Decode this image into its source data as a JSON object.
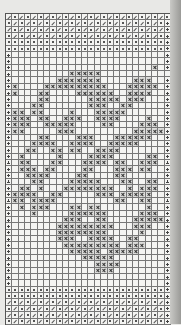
{
  "chart": {
    "title": "",
    "columns": 26,
    "symbols": {
      ".": "empty",
      "x": "cross-stitch",
      "d": "dot",
      "s": "slash",
      "p": "plus",
      "m": "minus"
    },
    "rows": [
      "sdsdsdsdsdsdsdsdsdsdsdsdsd",
      "dsdsdsdsdsdsdsdsdsdsdsdsdp",
      "sdsdsdsdsdsdsdsdsdsdsdsdsp",
      "dsdsdsdsdsdsdsdsdsdsdsdsdp",
      "dddddddddddddddddddddddddp",
      "dddddddddddddddddddddddddp",
      "p........................p",
      "p........................p",
      "p......................x.p",
      "p.........xxxxx...........",
      "p.......xxxxxxx.....xxx..p",
      "px....xxxxxxxxxx...xxxxx.p",
      "px...xx....xxxxxx..xxxx..p",
      "p....xx......xxxxx.xxx...p",
      "p...xx.......xxx..xx.....p",
      "pxx.xx....x...xxxxx......p",
      "pxxx.xx..xxx..xxxx....x..p",
      "pxxx..xxxxx....xx....xxx.p",
      "pxx.....xxx.........xxxxxp",
      "p....xx....xxx...xxxxxx..p",
      "p...xxxx..xxxx..xxxxx....p",
      "p..xx..xx.xx..xxxx.......p",
      "p.x.....x....xxxx.....xx.p",
      "p.xx...xx...xxxx.xx..xxx.p",
      "p.xxx.xx....xx...xxx.xx..p",
      "p..xxxx....xx....xx......p",
      "p...xx....xxxxx...xx..xx.p",
      "p.xx.x...xxxxxxxx..x.xxx.p",
      "pxxxx..xx.....xxx.xxxxx..p",
      "pxx.xxxx.........xx..xx..p",
      "p.x.xxx...xx.xx.......x..p",
      "p...x.....xxxxxx.....xxx.p",
      "p........xxx..xx....xxxxxp",
      "p.......xxxxxxxxx...xxx..p",
      "p.......xxxxxxxx.....x...p",
      "p.......xxx..xxxx..xx....p",
      "p........xxxxxxxxx.xxx...p",
      "p.........xxxxx.xxxxx....p",
      "p...........xxxxx........p",
      "p.............xxxx.......p",
      "p.............xxx........p",
      "p........................p",
      "p........................p",
      "dddddddddddddddddddddddddp",
      "dddddddddddddddddddddddddp",
      "sdsdsdsdsdsdsdsdsdsdsdsdsp",
      "dsdsdsdsdsdsdsdsdsdsdsdsdp",
      "sdsdsdsdsdsdsdsdsdsdsdsdsp",
      "dsdsdsdsdsdsdsdsdsdsdsdsdp"
    ]
  }
}
